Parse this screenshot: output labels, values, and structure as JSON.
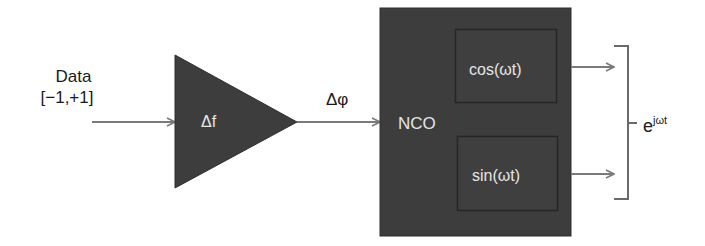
{
  "diagram": {
    "type": "block-diagram",
    "input": {
      "label_line1": "Data",
      "label_line2": "[−1,+1]"
    },
    "gain_block": {
      "shape": "triangle",
      "label": "Δf"
    },
    "phase_signal": {
      "label": "Δφ"
    },
    "nco_block": {
      "label": "NCO",
      "outputs": [
        {
          "label": "cos(ωt)"
        },
        {
          "label": "sin(ωt)"
        }
      ]
    },
    "output": {
      "label_base": "e",
      "label_exponent": "jωt"
    },
    "colors": {
      "block_fill": "#3d3d3d",
      "inner_box_stroke": "#262626",
      "arrow": "#7a7a7a",
      "bracket": "#6a6a6a",
      "text_dark": "#1a1a1a",
      "text_light": "#e6e6e6"
    }
  }
}
